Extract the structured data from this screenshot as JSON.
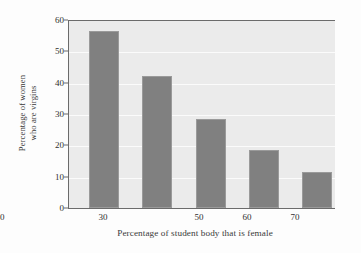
{
  "chart_data": {
    "type": "bar",
    "title": "",
    "subtitle": "",
    "xlabel": "Percentage of student body that is female",
    "ylabel_line1": "Percentage of women",
    "ylabel_line2": "who are virgins",
    "ylabel": "Percentage of women who are virgins",
    "categories": [
      "30",
      "40",
      "50",
      "60",
      "70"
    ],
    "values": [
      56.5,
      42,
      28.5,
      18.5,
      11.5
    ],
    "xlim": [
      25,
      75
    ],
    "ylim": [
      0,
      60
    ],
    "yticks": [
      "0",
      "10",
      "20",
      "30",
      "40",
      "50",
      "60"
    ],
    "ytick_values": [
      0,
      10,
      20,
      30,
      40,
      50,
      60
    ],
    "xticks": [
      "30",
      "40",
      "50",
      "60",
      "70"
    ],
    "grid": "horizontal",
    "legend": "none",
    "annotations": []
  },
  "style": {
    "bar_color": "#808080",
    "bar_edge_color": "#9a9a9a",
    "plot_background": "#ebebeb",
    "gridline_color": "#fbfbfb",
    "axis_color": "#6b6b6b",
    "text_color": "#2f2f2f",
    "page_background": "#fdfdfd"
  }
}
